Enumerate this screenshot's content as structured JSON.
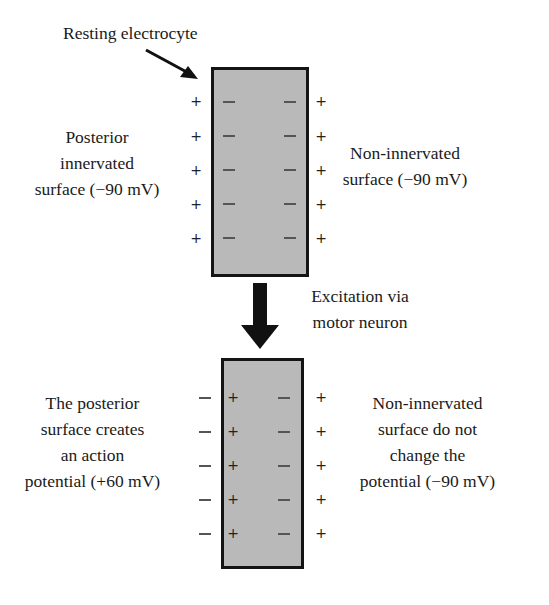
{
  "top": {
    "title": "Resting electrocyte",
    "left_label": [
      "Posterior",
      "innervated",
      "surface (−90 mV)"
    ],
    "right_label": [
      "Non-innervated",
      "surface (−90 mV)"
    ],
    "outer_left_signs": [
      "+",
      "+",
      "+",
      "+",
      "+"
    ],
    "inner_left_signs": [
      "−",
      "−",
      "−",
      "−",
      "−"
    ],
    "inner_right_signs": [
      "−",
      "−",
      "−",
      "−",
      "−"
    ],
    "outer_right_signs": [
      "+",
      "+",
      "+",
      "+",
      "+"
    ]
  },
  "transition": {
    "label": [
      "Excitation via",
      "motor neuron"
    ]
  },
  "bottom": {
    "left_label": [
      "The posterior",
      "surface creates",
      "an action",
      "potential (+60 mV)"
    ],
    "right_label": [
      "Non-innervated",
      "surface do not",
      "change the",
      "potential (−90 mV)"
    ],
    "outer_left_signs": [
      "−",
      "−",
      "−",
      "−",
      "−"
    ],
    "inner_left_signs": [
      "+",
      "+",
      "+",
      "+",
      "+"
    ],
    "inner_right_signs": [
      "−",
      "−",
      "−",
      "−",
      "−"
    ],
    "outer_right_signs": [
      "+",
      "+",
      "+",
      "+",
      "+"
    ]
  }
}
